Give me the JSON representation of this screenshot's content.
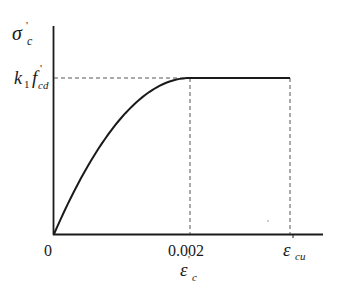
{
  "diagram": {
    "type": "stress-strain",
    "y_axis_label": {
      "symbol": "σ",
      "prime": "'",
      "subscript": "c"
    },
    "plateau_label": {
      "coef": "k",
      "coef_sub": "1",
      "symbol": "f",
      "prime": "'",
      "subscript": "cd"
    },
    "x_ticks": [
      {
        "label": "0",
        "value": 0
      },
      {
        "label": "0.002",
        "value": 0.002
      },
      {
        "symbol": "ε",
        "subscript": "cu",
        "value": 0.0035
      }
    ],
    "x_axis_label": {
      "symbol": "ε",
      "prime": "'",
      "subscript": "c"
    },
    "segments": [
      {
        "name": "parabolic",
        "from_strain": 0,
        "to_strain": 0.002,
        "shape": "parabola"
      },
      {
        "name": "plateau",
        "from_strain": 0.002,
        "to_strain": "ε_cu",
        "shape": "constant"
      }
    ],
    "guides": [
      "horizontal dashed at k1·f'cd",
      "vertical dashed at 0.002",
      "vertical dashed at ε_cu"
    ]
  }
}
